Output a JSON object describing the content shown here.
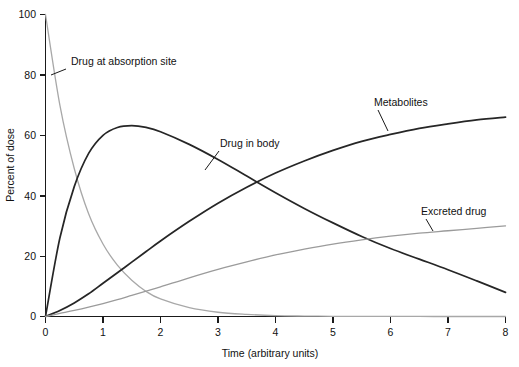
{
  "chart_data": {
    "type": "line",
    "title": "",
    "xlabel": "Time (arbitrary units)",
    "ylabel": "Percent of dose",
    "xlim": [
      0,
      8
    ],
    "ylim": [
      0,
      100
    ],
    "xticks": [
      0,
      1,
      2,
      3,
      4,
      5,
      6,
      7,
      8
    ],
    "xtick_labels": [
      "0",
      "1",
      "2",
      "3",
      "4",
      "5",
      "6",
      "7",
      "8"
    ],
    "yticks": [
      0,
      20,
      40,
      60,
      80,
      100
    ],
    "ytick_labels": [
      "0",
      "20",
      "40",
      "60",
      "80",
      "100"
    ],
    "grid": false,
    "legend_position": "inline-annotations",
    "x": [
      0,
      0.25,
      0.5,
      0.75,
      1,
      1.25,
      1.5,
      1.75,
      2,
      2.5,
      3,
      3.5,
      4,
      4.5,
      5,
      5.5,
      6,
      6.5,
      7,
      7.5,
      8
    ],
    "series": [
      {
        "name": "Drug at absorption site",
        "color": "#a8a8a8",
        "linewidth": 1.3,
        "values": [
          100,
          70,
          49,
          34,
          24,
          17,
          12,
          8.3,
          5.8,
          2.9,
          1.4,
          0.7,
          0.3,
          0.15,
          0.07,
          0.03,
          0.02,
          0.01,
          0.0,
          0.0,
          0.0
        ]
      },
      {
        "name": "Drug in body",
        "color": "#262626",
        "linewidth": 1.7,
        "values": [
          0,
          26,
          43,
          54,
          60,
          62.6,
          63.2,
          62.6,
          61.2,
          57,
          52,
          46.5,
          41,
          35.8,
          31,
          26.5,
          22.5,
          19,
          15.5,
          11.8,
          8
        ]
      },
      {
        "name": "Metabolites",
        "color": "#262626",
        "linewidth": 1.8,
        "values": [
          0,
          2,
          4.5,
          7.5,
          11,
          14.5,
          18,
          21.5,
          25,
          31.5,
          37.5,
          42.8,
          47.5,
          51.5,
          55,
          58,
          60.3,
          62.3,
          63.8,
          65.1,
          66
        ]
      },
      {
        "name": "Excreted drug",
        "color": "#9b9b9b",
        "linewidth": 1.3,
        "values": [
          0,
          1,
          2,
          3.1,
          4.3,
          5.6,
          7,
          8.4,
          9.8,
          12.8,
          15.6,
          18.1,
          20.4,
          22.3,
          24,
          25.4,
          26.6,
          27.6,
          28.4,
          29.2,
          30
        ]
      }
    ],
    "annotations": [
      {
        "text": "Drug at absorption site",
        "label_x": 71,
        "label_y": 65,
        "leader_from_x": 66,
        "leader_from_y": 69,
        "leader_to_x": 51,
        "leader_to_y": 75
      },
      {
        "text": "Drug in body",
        "label_x": 220,
        "label_y": 147,
        "leader_from_x": 219,
        "leader_from_y": 151,
        "leader_to_x": 205,
        "leader_to_y": 170
      },
      {
        "text": "Metabolites",
        "label_x": 374,
        "label_y": 106,
        "leader_from_x": 378,
        "leader_from_y": 110,
        "leader_to_x": 388,
        "leader_to_y": 131
      },
      {
        "text": "Excreted drug",
        "label_x": 421,
        "label_y": 215,
        "leader_from_x": 426,
        "leader_from_y": 219,
        "leader_to_x": 433,
        "leader_to_y": 231
      }
    ]
  },
  "axes": {
    "y_axis_title": "Percent of dose",
    "x_axis_title": "Time (arbitrary units)",
    "x_tick_0": "0",
    "x_tick_1": "1",
    "x_tick_2": "2",
    "x_tick_3": "3",
    "x_tick_4": "4",
    "x_tick_5": "5",
    "x_tick_6": "6",
    "x_tick_7": "7",
    "x_tick_8": "8",
    "y_tick_0": "0",
    "y_tick_20": "20",
    "y_tick_40": "40",
    "y_tick_60": "60",
    "y_tick_80": "80",
    "y_tick_100": "100"
  },
  "labels": {
    "absorption": "Drug at absorption site",
    "body": "Drug in body",
    "metabolites": "Metabolites",
    "excreted": "Excreted drug"
  }
}
